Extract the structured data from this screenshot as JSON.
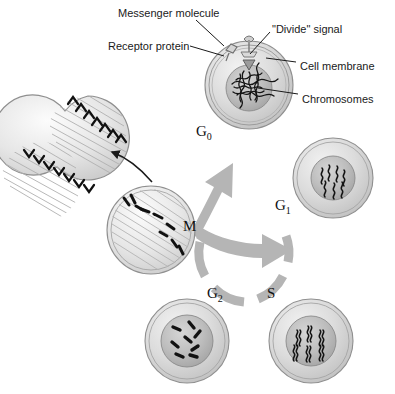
{
  "figure": {
    "background_color": "#ffffff",
    "line_color": "#1a1a1a",
    "arrow_color": "#b3b3b3",
    "cell_fill_color": "#d8d8d8",
    "nucleus_fill_color": "#b9b9b9"
  },
  "callouts": [
    {
      "id": "messenger-molecule",
      "label": "Messenger molecule",
      "x": 118,
      "y": 8
    },
    {
      "id": "receptor-protein",
      "label": "Receptor protein",
      "x": 108,
      "y": 41
    },
    {
      "id": "divide-signal",
      "label": "\"Divide\" signal",
      "x": 272,
      "y": 24
    },
    {
      "id": "cell-membrane",
      "label": "Cell membrane",
      "x": 300,
      "y": 61
    },
    {
      "id": "chromosomes",
      "label": "Chromosomes",
      "x": 302,
      "y": 94
    }
  ],
  "stages": [
    {
      "id": "g0",
      "label": "G",
      "subscript": "0",
      "x": 196,
      "y": 124,
      "cell": {
        "cx": 249,
        "cy": 85,
        "r": 44,
        "nucleus_r": 23,
        "chromatin": "tangled-mass"
      }
    },
    {
      "id": "g1",
      "label": "G",
      "subscript": "1",
      "x": 275,
      "y": 198,
      "cell": {
        "cx": 333,
        "cy": 178,
        "r": 40,
        "nucleus_r": 22,
        "chromatin": "wavy-single"
      }
    },
    {
      "id": "s",
      "label": "S",
      "subscript": "",
      "x": 267,
      "y": 286,
      "cell": {
        "cx": 311,
        "cy": 341,
        "r": 42,
        "nucleus_r": 25,
        "chromatin": "wavy-doubled"
      }
    },
    {
      "id": "g2",
      "label": "G",
      "subscript": "2",
      "x": 207,
      "y": 286,
      "cell": {
        "cx": 187,
        "cy": 341,
        "r": 42,
        "nucleus_r": 26,
        "chromatin": "condensed-rods"
      }
    },
    {
      "id": "m",
      "label": "M",
      "subscript": "",
      "x": 183,
      "y": 219,
      "cell": {
        "cx": 151,
        "cy": 230,
        "r": 44,
        "nucleus_r": 0,
        "chromatin": "metaphase-spindle"
      }
    }
  ],
  "dividing_cell": {
    "id": "dividing-cell",
    "description": "Two daughter cells separating with spindle fibres and chevron chromosomes",
    "cx": 63,
    "cy": 161
  },
  "cycle_arrows": {
    "ring_segments": 5,
    "branch_description": "Arrow branches from M upward to G0 and rightward to G1",
    "mitosis_arrow_description": "Curved arrow from M cell to dividing cell"
  }
}
